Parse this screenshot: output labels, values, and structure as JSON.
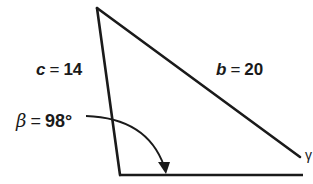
{
  "figure": {
    "type": "triangle",
    "stroke_color": "#1a1a1a",
    "background": "#ffffff",
    "vertices": {
      "top": [
        97,
        8
      ],
      "bottom_left": [
        120,
        175
      ],
      "right": [
        300,
        157
      ]
    },
    "base_line_end": [
      303,
      175
    ]
  },
  "labels": {
    "side_c": {
      "var": "c",
      "eq": "=",
      "value": "14"
    },
    "side_b": {
      "var": "b",
      "eq": "=",
      "value": "20"
    },
    "angle_beta": {
      "var": "β",
      "eq": "=",
      "value": "98°"
    },
    "partial_glyph": "γ"
  },
  "annotations": {
    "angle_arc": {
      "from": [
        86,
        116
      ],
      "to": [
        165,
        172
      ],
      "arrow": true,
      "target": "angle beta at bottom-left vertex"
    }
  }
}
